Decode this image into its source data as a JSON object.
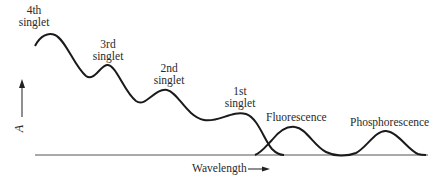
{
  "diagram": {
    "y_axis": {
      "label": "A",
      "arrow": "up"
    },
    "x_axis": {
      "label": "Wavelength",
      "arrow": "right"
    },
    "peaks": [
      {
        "id": "4th-singlet",
        "line1": "4th",
        "line2": "singlet"
      },
      {
        "id": "3rd-singlet",
        "line1": "3rd",
        "line2": "singlet"
      },
      {
        "id": "2nd-singlet",
        "line1": "2nd",
        "line2": "singlet"
      },
      {
        "id": "1st-singlet",
        "line1": "1st",
        "line2": "singlet"
      }
    ],
    "emission_bands": [
      {
        "id": "fluorescence",
        "label": "Fluorescence"
      },
      {
        "id": "phosphorescence",
        "label": "Phosphorescence"
      }
    ],
    "colors": {
      "curve": "#1a1a1a",
      "baseline": "#555555",
      "text": "#2a2a2a",
      "background": "#ffffff"
    }
  }
}
